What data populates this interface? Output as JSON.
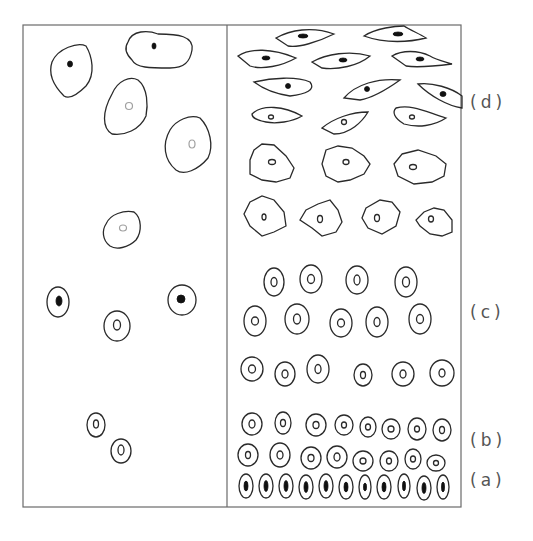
{
  "figure": {
    "frame": {
      "x": 23,
      "y": 25,
      "width": 438,
      "height": 482,
      "divider_x": 227
    },
    "labels": [
      {
        "id": "d",
        "text": "(d)",
        "x": 470,
        "y": 108
      },
      {
        "id": "c",
        "text": "(c)",
        "x": 470,
        "y": 318
      },
      {
        "id": "b",
        "text": "(b)",
        "x": 470,
        "y": 446
      },
      {
        "id": "a",
        "text": "(a)",
        "x": 470,
        "y": 486
      }
    ],
    "left_panel_cells": [
      {
        "shape": "path",
        "d": "M52,62 C58,48 78,42 86,46 C92,56 96,74 86,86 C78,94 70,100 64,96 C54,86 48,74 52,62 Z",
        "nucleus": {
          "cx": 70,
          "cy": 64,
          "rx": 2.5,
          "ry": 3,
          "type": "solid"
        }
      },
      {
        "shape": "path",
        "d": "M128,42 C132,30 148,30 158,34 C178,34 194,36 192,50 C190,62 184,68 170,68 C150,68 136,68 132,60 C126,54 124,48 128,42 Z",
        "nucleus": {
          "cx": 154,
          "cy": 46,
          "rx": 2,
          "ry": 3,
          "type": "solid"
        }
      },
      {
        "shape": "path",
        "d": "M112,94 C118,80 130,76 138,80 C148,88 148,106 146,116 C140,130 124,136 112,134 C102,128 102,112 112,94 Z",
        "nucleus": {
          "cx": 129,
          "cy": 106,
          "rx": 3.5,
          "ry": 3.5,
          "type": "faint"
        }
      },
      {
        "shape": "path",
        "d": "M170,130 C176,120 190,114 200,118 C210,128 214,146 208,158 C198,170 184,176 176,170 C164,160 162,144 170,130 Z",
        "nucleus": {
          "cx": 192,
          "cy": 144,
          "rx": 3,
          "ry": 4,
          "type": "faint"
        }
      },
      {
        "shape": "path",
        "d": "M106,224 C110,214 124,210 134,212 C142,218 142,232 136,240 C128,248 116,250 110,246 C102,240 102,230 106,224 Z",
        "nucleus": {
          "cx": 123,
          "cy": 228,
          "rx": 3.5,
          "ry": 3,
          "type": "faint"
        }
      },
      {
        "shape": "ellipse",
        "cx": 58,
        "cy": 302,
        "rx": 11,
        "ry": 15,
        "nucleus": {
          "cx": 59,
          "cy": 301,
          "rx": 3,
          "ry": 5,
          "type": "solid"
        }
      },
      {
        "shape": "ellipse",
        "cx": 182,
        "cy": 300,
        "rx": 14,
        "ry": 15,
        "nucleus": {
          "cx": 181,
          "cy": 299,
          "rx": 4,
          "ry": 4,
          "type": "solid"
        }
      },
      {
        "shape": "ellipse",
        "cx": 117,
        "cy": 326,
        "rx": 13,
        "ry": 15,
        "nucleus": {
          "cx": 117,
          "cy": 325,
          "rx": 3.5,
          "ry": 5,
          "type": "open"
        }
      },
      {
        "shape": "ellipse",
        "cx": 96,
        "cy": 425,
        "rx": 9,
        "ry": 12,
        "nucleus": {
          "cx": 96,
          "cy": 424,
          "rx": 2.5,
          "ry": 4,
          "type": "open"
        }
      },
      {
        "shape": "ellipse",
        "cx": 121,
        "cy": 451,
        "rx": 10,
        "ry": 12,
        "nucleus": {
          "cx": 121,
          "cy": 450,
          "rx": 3,
          "ry": 5,
          "type": "open"
        }
      }
    ],
    "right_panel_rows": [
      {
        "stage": "d",
        "row": "spindle-1",
        "cells": [
          {
            "shape": "path",
            "d": "M276,38 C290,30 312,26 334,34 C318,42 298,48 288,46 Z",
            "nucleus": {
              "cx": 303,
              "cy": 36,
              "rx": 5,
              "ry": 2,
              "type": "solid"
            }
          },
          {
            "shape": "path",
            "d": "M364,36 C376,28 396,26 404,26 C410,30 420,34 426,38 C410,42 386,44 364,36 Z",
            "nucleus": {
              "cx": 398,
              "cy": 34,
              "rx": 5,
              "ry": 2,
              "type": "solid"
            }
          }
        ]
      },
      {
        "stage": "d",
        "row": "spindle-2",
        "cells": [
          {
            "shape": "path",
            "d": "M238,56 C250,48 272,48 296,58 C282,66 262,70 250,66 Z",
            "nucleus": {
              "cx": 266,
              "cy": 58,
              "rx": 4,
              "ry": 2,
              "type": "solid"
            }
          },
          {
            "shape": "path",
            "d": "M312,62 C326,54 350,50 370,56 C358,66 338,70 322,68 Z",
            "nucleus": {
              "cx": 343,
              "cy": 60,
              "rx": 4,
              "ry": 2,
              "type": "solid"
            }
          },
          {
            "shape": "path",
            "d": "M392,56 C402,50 418,50 430,56 C436,60 446,62 452,64 C436,66 418,68 406,66 Z",
            "nucleus": {
              "cx": 420,
              "cy": 59,
              "rx": 4,
              "ry": 2,
              "type": "solid"
            }
          }
        ]
      },
      {
        "stage": "d",
        "row": "spindle-3",
        "cells": [
          {
            "shape": "path",
            "d": "M254,82 C272,78 296,76 310,82 C316,90 306,94 290,96 C276,94 262,88 254,82 Z",
            "nucleus": {
              "cx": 288,
              "cy": 86,
              "rx": 2.5,
              "ry": 2.5,
              "type": "solid"
            }
          },
          {
            "shape": "path",
            "d": "M344,98 C356,84 378,78 400,80 C386,90 372,98 360,100 Z",
            "nucleus": {
              "cx": 367,
              "cy": 89,
              "rx": 2.5,
              "ry": 2.5,
              "type": "solid"
            }
          },
          {
            "shape": "path",
            "d": "M418,84 C432,82 452,88 462,96 L462,108 C448,106 430,96 418,84 Z",
            "nucleus": {
              "cx": 443,
              "cy": 94,
              "rx": 3,
              "ry": 2.5,
              "type": "solid"
            }
          }
        ]
      },
      {
        "stage": "d",
        "row": "spindle-4",
        "cells": [
          {
            "shape": "path",
            "d": "M252,114 C262,104 284,106 302,116 C292,122 276,124 266,122 C256,120 252,118 252,114 Z",
            "nucleus": {
              "cx": 271,
              "cy": 117,
              "rx": 2.5,
              "ry": 2,
              "type": "open"
            }
          },
          {
            "shape": "path",
            "d": "M322,128 C334,118 352,112 368,112 C362,122 350,134 334,134 Z",
            "nucleus": {
              "cx": 344,
              "cy": 122,
              "rx": 2.5,
              "ry": 2.5,
              "type": "open"
            }
          },
          {
            "shape": "path",
            "d": "M396,108 C412,104 426,112 446,118 C434,126 418,128 404,124 C394,118 392,112 396,108 Z",
            "nucleus": {
              "cx": 412,
              "cy": 117,
              "rx": 2.5,
              "ry": 2,
              "type": "open"
            }
          }
        ]
      },
      {
        "stage": "d",
        "row": "polygonal-1",
        "cells": [
          {
            "shape": "path",
            "d": "M254,150 L262,144 L274,145 L286,156 L294,168 L290,178 L276,182 L262,180 L250,174 L250,160 Z",
            "nucleus": {
              "cx": 272,
              "cy": 162,
              "rx": 3.5,
              "ry": 2.5,
              "type": "open"
            }
          },
          {
            "shape": "path",
            "d": "M326,150 L338,146 L352,148 L364,156 L370,164 L364,174 L350,180 L338,182 L326,176 L322,164 Z",
            "nucleus": {
              "cx": 346,
              "cy": 162,
              "rx": 3,
              "ry": 2.5,
              "type": "open"
            }
          },
          {
            "shape": "path",
            "d": "M402,154 L418,150 L436,156 L446,164 L444,176 L432,182 L414,184 L398,176 L394,164 Z",
            "nucleus": {
              "cx": 413,
              "cy": 167,
              "rx": 3.5,
              "ry": 2.5,
              "type": "open"
            }
          }
        ]
      },
      {
        "stage": "d",
        "row": "polygonal-2",
        "cells": [
          {
            "shape": "path",
            "d": "M250,202 L262,196 L274,200 L284,212 L286,226 L274,232 L262,236 L250,226 L244,214 Z",
            "nucleus": {
              "cx": 264,
              "cy": 217,
              "rx": 2,
              "ry": 3,
              "type": "open"
            }
          },
          {
            "shape": "path",
            "d": "M306,210 L318,204 L330,200 L338,210 L342,222 L336,232 L322,236 L312,228 L300,220 Z",
            "nucleus": {
              "cx": 320,
              "cy": 219,
              "rx": 2.5,
              "ry": 3.5,
              "type": "open"
            }
          },
          {
            "shape": "path",
            "d": "M366,208 L380,200 L392,202 L400,212 L396,226 L382,234 L368,228 L362,218 Z",
            "nucleus": {
              "cx": 377,
              "cy": 218,
              "rx": 2.5,
              "ry": 3.5,
              "type": "open"
            }
          },
          {
            "shape": "path",
            "d": "M424,212 L434,208 L444,210 L452,220 L452,232 L442,236 L430,234 L420,226 L416,220 Z",
            "nucleus": {
              "cx": 431,
              "cy": 219,
              "rx": 2.5,
              "ry": 3,
              "type": "open"
            }
          }
        ]
      }
    ],
    "right_panel_ellipse_rows": [
      {
        "stage": "c",
        "cells": [
          {
            "cx": 274,
            "cy": 282,
            "rx": 10,
            "ry": 14,
            "nrx": 3,
            "nry": 4.5,
            "type": "open"
          },
          {
            "cx": 311,
            "cy": 279,
            "rx": 11,
            "ry": 14,
            "nrx": 3.5,
            "nry": 4.5,
            "type": "open"
          },
          {
            "cx": 357,
            "cy": 280,
            "rx": 11,
            "ry": 14,
            "nrx": 3,
            "nry": 5,
            "type": "open"
          },
          {
            "cx": 406,
            "cy": 282,
            "rx": 11,
            "ry": 15,
            "nrx": 3.5,
            "nry": 5,
            "type": "open"
          }
        ]
      },
      {
        "stage": "c",
        "cells": [
          {
            "cx": 255,
            "cy": 321,
            "rx": 11,
            "ry": 15,
            "nrx": 3.5,
            "nry": 4,
            "type": "open"
          },
          {
            "cx": 297,
            "cy": 319,
            "rx": 12,
            "ry": 15,
            "nrx": 3.5,
            "nry": 5,
            "type": "open"
          },
          {
            "cx": 341,
            "cy": 323,
            "rx": 11,
            "ry": 14,
            "nrx": 3.5,
            "nry": 4,
            "type": "open"
          },
          {
            "cx": 377,
            "cy": 322,
            "rx": 11,
            "ry": 15,
            "nrx": 3,
            "nry": 4.5,
            "type": "open"
          },
          {
            "cx": 420,
            "cy": 319,
            "rx": 11,
            "ry": 15,
            "nrx": 3.5,
            "nry": 4.5,
            "type": "open"
          }
        ]
      },
      {
        "stage": "c",
        "cells": [
          {
            "cx": 252,
            "cy": 369,
            "rx": 11,
            "ry": 12,
            "nrx": 3.5,
            "nry": 4,
            "type": "open"
          },
          {
            "cx": 285,
            "cy": 374,
            "rx": 10,
            "ry": 12,
            "nrx": 3,
            "nry": 4,
            "type": "open"
          },
          {
            "cx": 318,
            "cy": 369,
            "rx": 11,
            "ry": 14,
            "nrx": 3,
            "nry": 4.5,
            "type": "open"
          },
          {
            "cx": 363,
            "cy": 375,
            "rx": 9,
            "ry": 11,
            "nrx": 2.5,
            "nry": 3.5,
            "type": "open"
          },
          {
            "cx": 403,
            "cy": 374,
            "rx": 11,
            "ry": 12,
            "nrx": 3,
            "nry": 4,
            "type": "open"
          },
          {
            "cx": 442,
            "cy": 373,
            "rx": 12,
            "ry": 13,
            "nrx": 3,
            "nry": 4,
            "type": "open"
          }
        ]
      },
      {
        "stage": "b",
        "cells": [
          {
            "cx": 252,
            "cy": 424,
            "rx": 10,
            "ry": 11,
            "nrx": 3,
            "nry": 4,
            "type": "open"
          },
          {
            "cx": 283,
            "cy": 423,
            "rx": 8,
            "ry": 11,
            "nrx": 2.5,
            "nry": 3.5,
            "type": "open"
          },
          {
            "cx": 316,
            "cy": 425,
            "rx": 10,
            "ry": 11,
            "nrx": 3,
            "nry": 3.5,
            "type": "open"
          },
          {
            "cx": 344,
            "cy": 425,
            "rx": 9,
            "ry": 10,
            "nrx": 2.5,
            "nry": 3,
            "type": "open"
          },
          {
            "cx": 368,
            "cy": 427,
            "rx": 8,
            "ry": 10,
            "nrx": 2.5,
            "nry": 3,
            "type": "open"
          },
          {
            "cx": 391,
            "cy": 429,
            "rx": 9,
            "ry": 10,
            "nrx": 3,
            "nry": 3,
            "type": "open"
          },
          {
            "cx": 417,
            "cy": 429,
            "rx": 9,
            "ry": 11,
            "nrx": 2.5,
            "nry": 3,
            "type": "open"
          },
          {
            "cx": 442,
            "cy": 430,
            "rx": 9,
            "ry": 11,
            "nrx": 2.5,
            "nry": 3.5,
            "type": "open"
          }
        ]
      },
      {
        "stage": "b",
        "cells": [
          {
            "cx": 248,
            "cy": 455,
            "rx": 10,
            "ry": 11,
            "nrx": 2.5,
            "nry": 3.5,
            "type": "open"
          },
          {
            "cx": 280,
            "cy": 455,
            "rx": 10,
            "ry": 12,
            "nrx": 3,
            "nry": 4,
            "type": "open"
          },
          {
            "cx": 311,
            "cy": 458,
            "rx": 10,
            "ry": 11,
            "nrx": 3,
            "nry": 3.5,
            "type": "open"
          },
          {
            "cx": 337,
            "cy": 457,
            "rx": 10,
            "ry": 11,
            "nrx": 3,
            "nry": 4,
            "type": "open"
          },
          {
            "cx": 363,
            "cy": 461,
            "rx": 10,
            "ry": 10,
            "nrx": 3,
            "nry": 3,
            "type": "open"
          },
          {
            "cx": 389,
            "cy": 461,
            "rx": 9,
            "ry": 10,
            "nrx": 2.5,
            "nry": 3,
            "type": "open"
          },
          {
            "cx": 413,
            "cy": 459,
            "rx": 8,
            "ry": 10,
            "nrx": 2.5,
            "nry": 3,
            "type": "open"
          },
          {
            "cx": 436,
            "cy": 463,
            "rx": 9,
            "ry": 8,
            "nrx": 2.5,
            "nry": 2.5,
            "type": "open"
          }
        ]
      },
      {
        "stage": "a",
        "cells": [
          {
            "cx": 246,
            "cy": 486,
            "rx": 7,
            "ry": 12,
            "nrx": 2,
            "nry": 5,
            "type": "solid"
          },
          {
            "cx": 266,
            "cy": 486,
            "rx": 7,
            "ry": 12,
            "nrx": 2,
            "nry": 5.5,
            "type": "solid"
          },
          {
            "cx": 286,
            "cy": 486,
            "rx": 7,
            "ry": 12,
            "nrx": 2,
            "nry": 5.5,
            "type": "solid"
          },
          {
            "cx": 306,
            "cy": 487,
            "rx": 7,
            "ry": 12,
            "nrx": 2,
            "nry": 5.5,
            "type": "solid"
          },
          {
            "cx": 326,
            "cy": 486,
            "rx": 7,
            "ry": 12,
            "nrx": 2,
            "nry": 5.5,
            "type": "solid"
          },
          {
            "cx": 346,
            "cy": 487,
            "rx": 7,
            "ry": 12,
            "nrx": 2,
            "nry": 5,
            "type": "solid"
          },
          {
            "cx": 365,
            "cy": 487,
            "rx": 6,
            "ry": 12,
            "nrx": 1.5,
            "nry": 4,
            "type": "solid"
          },
          {
            "cx": 384,
            "cy": 487,
            "rx": 7,
            "ry": 12,
            "nrx": 2,
            "nry": 5,
            "type": "solid"
          },
          {
            "cx": 404,
            "cy": 486,
            "rx": 6,
            "ry": 12,
            "nrx": 1.5,
            "nry": 5,
            "type": "solid"
          },
          {
            "cx": 424,
            "cy": 488,
            "rx": 7,
            "ry": 12,
            "nrx": 2,
            "nry": 5.5,
            "type": "solid"
          },
          {
            "cx": 443,
            "cy": 487,
            "rx": 6,
            "ry": 12,
            "nrx": 1.5,
            "nry": 5,
            "type": "solid"
          }
        ]
      }
    ]
  }
}
